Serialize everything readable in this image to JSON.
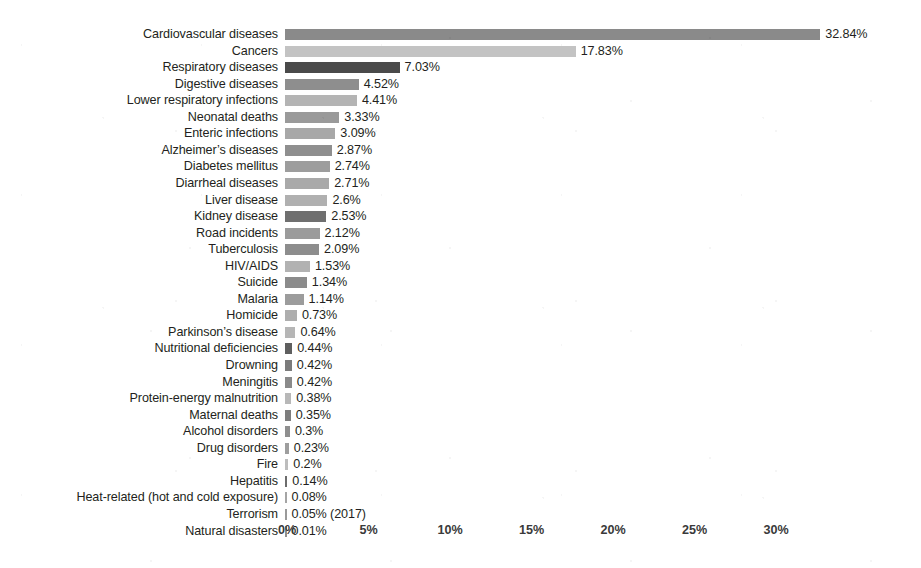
{
  "chart_data": {
    "type": "bar",
    "orientation": "horizontal",
    "title": "",
    "subtitle": "",
    "xlabel": "",
    "ylabel": "",
    "xlim": [
      0,
      33.8
    ],
    "xticks": [
      "0%",
      "5%",
      "10%",
      "15%",
      "20%",
      "25%",
      "30%"
    ],
    "xtick_values": [
      0,
      5,
      10,
      15,
      20,
      25,
      30
    ],
    "grid": false,
    "legend": "none",
    "value_suffix": "%",
    "categories": [
      "Cardiovascular diseases",
      "Cancers",
      "Respiratory diseases",
      "Digestive diseases",
      "Lower respiratory infections",
      "Neonatal deaths",
      "Enteric infections",
      "Alzheimer’s diseases",
      "Diabetes mellitus",
      "Diarrheal diseases",
      "Liver disease",
      "Kidney disease",
      "Road incidents",
      "Tuberculosis",
      "HIV/AIDS",
      "Suicide",
      "Malaria",
      "Homicide",
      "Parkinson’s disease",
      "Nutritional deficiencies",
      "Drowning",
      "Meningitis",
      "Protein-energy malnutrition",
      "Maternal deaths",
      "Alcohol disorders",
      "Drug disorders",
      "Fire",
      "Hepatitis",
      "Heat-related (hot and cold exposure)",
      "Terrorism",
      "Natural disasters"
    ],
    "values": [
      32.84,
      17.83,
      7.03,
      4.52,
      4.41,
      3.33,
      3.09,
      2.87,
      2.74,
      2.71,
      2.6,
      2.53,
      2.12,
      2.09,
      1.53,
      1.34,
      1.14,
      0.73,
      0.64,
      0.44,
      0.42,
      0.42,
      0.38,
      0.35,
      0.3,
      0.23,
      0.2,
      0.14,
      0.08,
      0.05,
      0.01
    ],
    "value_labels": [
      "32.84%",
      "17.83%",
      "7.03%",
      "4.52%",
      "4.41%",
      "3.33%",
      "3.09%",
      "2.87%",
      "2.74%",
      "2.71%",
      "2.6%",
      "2.53%",
      "2.12%",
      "2.09%",
      "1.53%",
      "1.34%",
      "1.14%",
      "0.73%",
      "0.64%",
      "0.44%",
      "0.42%",
      "0.42%",
      "0.38%",
      "0.35%",
      "0.3%",
      "0.23%",
      "0.2%",
      "0.14%",
      "0.08%",
      "0.05% (2017)",
      "0.01%"
    ],
    "bar_colors": [
      "#8a8a8a",
      "#c3c3c3",
      "#4a4a4a",
      "#8e8e8e",
      "#b4b4b4",
      "#9a9a9a",
      "#a8a8a8",
      "#8f8f8f",
      "#9d9d9d",
      "#a9a9a9",
      "#b0b0b0",
      "#6f6f6f",
      "#9b9b9b",
      "#8d8d8d",
      "#b2b2b2",
      "#8b8b8b",
      "#9c9c9c",
      "#aeaeae",
      "#b6b6b6",
      "#5f5f5f",
      "#7b7b7b",
      "#8a8a8a",
      "#b8b8b8",
      "#7d7d7d",
      "#8f8f8f",
      "#9e9e9e",
      "#bdbdbd",
      "#6c6c6c",
      "#a5a5a5",
      "#9a9a9a",
      "#8f8f8f"
    ]
  },
  "colors": {
    "background": "#ffffff",
    "text": "#231f20",
    "axis_text": "#3a3a3a",
    "bar_default": "#8c8c8c"
  }
}
